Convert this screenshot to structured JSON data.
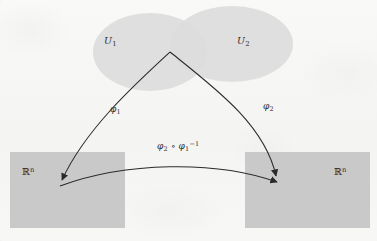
{
  "figure": {
    "type": "manifold-transition-map-diagram",
    "background_color": "#f7f7f6",
    "ink_color": "#2c2c2c",
    "chart_domains": [
      {
        "id": "U1",
        "label": "Ĵ1",
        "label_text": "U",
        "subscript": "1",
        "shape": "ellipse",
        "fill_color": "#dcdcdc",
        "center": [
          150,
          52
        ],
        "radii": [
          57,
          39
        ]
      },
      {
        "id": "U2",
        "label_text": "U",
        "subscript": "2",
        "shape": "ellipse",
        "fill_color": "#dcdcdc",
        "center": [
          232,
          44
        ],
        "radii": [
          61,
          38
        ]
      }
    ],
    "codomains": [
      {
        "id": "Rn-left",
        "label_text": "ℝ",
        "superscript": "n",
        "shape": "rectangle",
        "fill_color": "#c9c9c9",
        "rect": [
          10,
          152,
          115,
          76
        ]
      },
      {
        "id": "Rn-right",
        "label_text": "ℝ",
        "superscript": "n",
        "shape": "rectangle",
        "fill_color": "#c9c9c9",
        "rect": [
          245,
          152,
          125,
          76
        ]
      }
    ],
    "maps": [
      {
        "id": "phi1",
        "label_text": "φ",
        "subscript": "1",
        "from": "U1-overlap-apex",
        "to": "Rn-left",
        "arrow": true
      },
      {
        "id": "phi2",
        "label_text": "φ",
        "subscript": "2",
        "from": "U2-overlap-apex",
        "to": "Rn-right",
        "arrow": true
      },
      {
        "id": "transition",
        "label_text": "φ",
        "subscript": "2",
        "operator": " ∘ ",
        "label_text2": "φ",
        "subscript2": "1",
        "superscript2": "−1",
        "from": "Rn-left",
        "to": "Rn-right",
        "arrow": true
      }
    ]
  }
}
